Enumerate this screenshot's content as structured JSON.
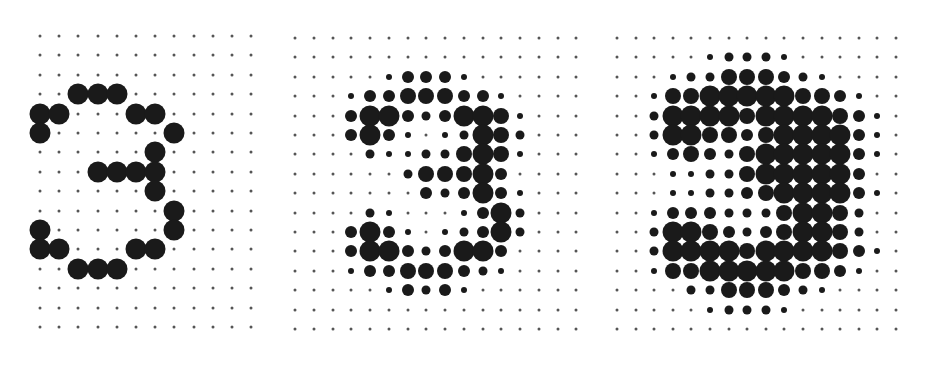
{
  "figure": {
    "dot_color": "#1a1a1a",
    "grid_dot_color": "#555555",
    "size_scale_px": [
      3,
      6,
      9,
      12,
      16,
      21
    ]
  },
  "panels": [
    {
      "name": "binary-digit-3",
      "origin_x": 40,
      "origin_y": 36,
      "step_x": 19.2,
      "step_y": 19.4,
      "cols": 12,
      "rows": 16,
      "grid": [
        "000000000000",
        "000000000000",
        "000000000000",
        "005550000000",
        "550005500000",
        "500000050000",
        "000000500000",
        "000555500000",
        "000000500000",
        "000000050000",
        "500000050000",
        "550005500000",
        "005550000000",
        "000000000000",
        "000000000000",
        "000000000000"
      ]
    },
    {
      "name": "halftone-digit-3",
      "origin_x": 295,
      "origin_y": 38,
      "step_x": 18.75,
      "step_y": 19.4,
      "cols": 16,
      "rows": 16,
      "grid": [
        "0000000000000000",
        "0000000000000000",
        "0000013331000000",
        "0001334443310000",
        "0003553235541000",
        "0003531012542000",
        "0000211224541000",
        "0000002444530000",
        "0000000323531000",
        "0000210001352000",
        "0003531012352000",
        "0003553235530000",
        "0001334443210000",
        "0000013231000000",
        "0000000000000000",
        "0000000000000000"
      ]
    },
    {
      "name": "bold-halftone-digit-3",
      "origin_x": 617,
      "origin_y": 38,
      "step_x": 18.6,
      "step_y": 19.4,
      "cols": 16,
      "rows": 16,
      "grid": [
        "0000000000000000",
        "0000012221000000",
        "0001224443210000",
        "0014455555443100",
        "0025555455554310",
        "0025544345555310",
        "0013432455555310",
        "0001122455555300",
        "0001122345555310",
        "0013332224554200",
        "0025543234554200",
        "0025555455554310",
        "0014455555443100",
        "0000224443210000",
        "0000012221000000",
        "0000000000000000"
      ]
    }
  ]
}
